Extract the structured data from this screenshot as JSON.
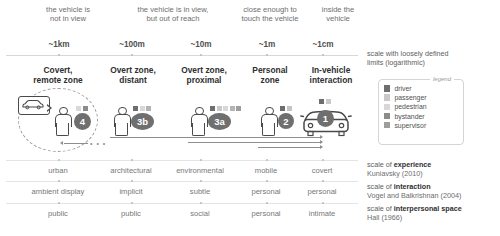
{
  "figure": {
    "descriptors": [
      "the vehicle is\nnot in view",
      "the vehicle is in view,\nbut out of reach",
      "close enough to\ntouch the vehicle",
      "inside the\nvehicle"
    ],
    "distances": [
      "~1km",
      "~100m",
      "~10m",
      "~1m",
      "~1cm"
    ],
    "distance_note": "scale with loosely defined\nlimits (logarithmic)",
    "zones": [
      {
        "title": "Covert,\nremote zone",
        "badge": "4",
        "actor": "person",
        "roles": [
          "pedestrian",
          "bystander"
        ],
        "has_remote_bubble": true
      },
      {
        "title": "Overt zone,\ndistant",
        "badge": "3b",
        "actor": "person",
        "roles": [
          "driver",
          "pedestrian",
          "bystander"
        ]
      },
      {
        "title": "Overt zone,\nproximal",
        "badge": "3a",
        "actor": "person",
        "roles": [
          "driver",
          "passenger",
          "pedestrian",
          "bystander",
          "supervisor"
        ]
      },
      {
        "title": "Personal\nzone",
        "badge": "2",
        "actor": "person",
        "roles": [
          "driver",
          "bystander"
        ]
      },
      {
        "title": "In-vehicle\ninteraction",
        "badge": "1",
        "actor": "car",
        "roles": [
          "driver",
          "passenger"
        ]
      }
    ],
    "scales": [
      {
        "name": "scale of ",
        "name_bold": "experience",
        "source": "Kuniavsky (2010)",
        "values": [
          "urban",
          "architectural",
          "environmental",
          "mobile",
          "covert"
        ]
      },
      {
        "name": "scale of ",
        "name_bold": "interaction",
        "source": "Vogel and Balkrishnan (2004)",
        "values": [
          "ambient display",
          "implicit",
          "subtle",
          "personal",
          "personal"
        ]
      },
      {
        "name": "scale of ",
        "name_bold": "interpersonal space",
        "source": "Hall (1966)",
        "values": [
          "public",
          "public",
          "social",
          "personal",
          "intimate"
        ]
      }
    ],
    "legend": {
      "caption": "legend",
      "items": [
        {
          "label": "driver",
          "color": "#6e6e6e"
        },
        {
          "label": "passenger",
          "color": "#c9c9c9"
        },
        {
          "label": "pedestrian",
          "color": "#d8d8d8"
        },
        {
          "label": "bystander",
          "color": "#8c8c8c"
        },
        {
          "label": "supervisor",
          "color": "#9e9e9e"
        }
      ]
    },
    "colors": {
      "badge": "#6f6f6f",
      "stroke": "#4a4a4a",
      "rule": "#d8d8d8",
      "text_muted": "#777777",
      "text_dark": "#2f2f2f"
    }
  }
}
